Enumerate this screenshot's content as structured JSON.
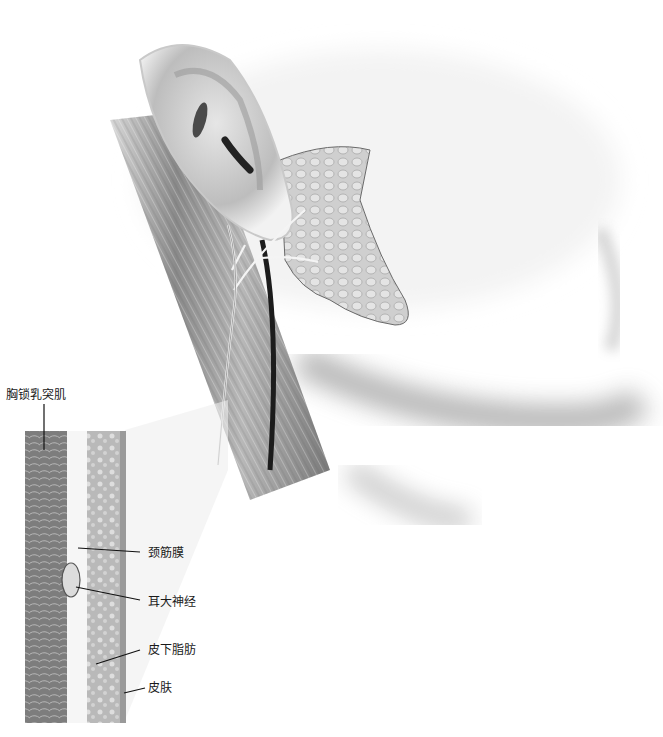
{
  "figure": {
    "labels": {
      "scm": "胸锁乳突肌",
      "cervical_fascia": "颈筋膜",
      "great_auricular_nerve": "耳大神经",
      "subcutaneous_fat": "皮下脂肪",
      "skin": "皮肤"
    }
  },
  "colors": {
    "background": "#ffffff",
    "label_text": "#1a1a1a",
    "leader_line": "#111111",
    "muscle_dark": "#6e6e6e",
    "muscle_light": "#b9b9b9",
    "fat": "#c8c8c8",
    "skin": "#9a9a9a",
    "vein": "#1c1c1c"
  }
}
